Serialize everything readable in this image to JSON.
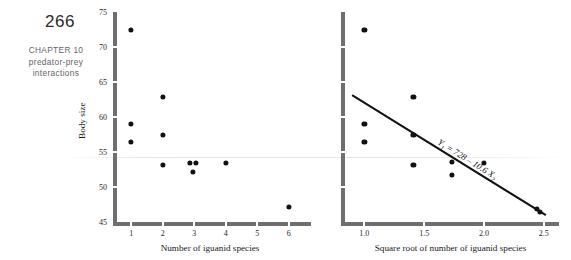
{
  "page": {
    "number": "266",
    "chapter_lines": [
      "CHAPTER 10",
      "predator-prey",
      "interactions"
    ]
  },
  "colors": {
    "axis_gray": "#6e6e6e",
    "dot_black": "#111111",
    "line_black": "#121212",
    "chapter_gray": "#5f6468"
  },
  "chart_data": [
    {
      "id": "left",
      "type": "scatter",
      "title": "",
      "xlabel": "Number of iguanid species",
      "ylabel": "Body size",
      "xlim": [
        0.55,
        6.45
      ],
      "ylim": [
        45,
        75
      ],
      "xticks": [
        1,
        2,
        3,
        4,
        5,
        6
      ],
      "xtick_labels": [
        "1",
        "2",
        "3",
        "4",
        "5",
        "6"
      ],
      "yticks": [
        45,
        50,
        55,
        60,
        65,
        70,
        75
      ],
      "ytick_labels": [
        "45",
        "50",
        "55",
        "60",
        "65",
        "70",
        "75"
      ],
      "grid": false,
      "legend": null,
      "points": [
        {
          "x": 1.0,
          "y": 72.4
        },
        {
          "x": 1.0,
          "y": 59.0
        },
        {
          "x": 1.0,
          "y": 56.5
        },
        {
          "x": 2.0,
          "y": 62.9
        },
        {
          "x": 2.0,
          "y": 57.4
        },
        {
          "x": 2.0,
          "y": 53.2
        },
        {
          "x": 2.85,
          "y": 53.4
        },
        {
          "x": 3.05,
          "y": 53.4
        },
        {
          "x": 2.95,
          "y": 52.1
        },
        {
          "x": 4.0,
          "y": 53.4
        },
        {
          "x": 6.0,
          "y": 47.1
        }
      ]
    },
    {
      "id": "right",
      "type": "scatter",
      "title": "",
      "xlabel": "Square root of number of iguanid species",
      "ylabel": "",
      "xlim": [
        0.88,
        2.56
      ],
      "ylim": [
        45,
        75
      ],
      "xticks": [
        1.0,
        1.5,
        2.0,
        2.5
      ],
      "xtick_labels": [
        "1.0",
        "1.5",
        "2.0",
        "2.5"
      ],
      "yticks": [
        45,
        50,
        55,
        60,
        65,
        70,
        75
      ],
      "ytick_labels": [
        "",
        "",
        "",
        "",
        "",
        "",
        ""
      ],
      "grid": false,
      "legend": null,
      "points": [
        {
          "x": 1.0,
          "y": 72.4
        },
        {
          "x": 1.0,
          "y": 59.0
        },
        {
          "x": 1.0,
          "y": 56.5
        },
        {
          "x": 1.41,
          "y": 62.9
        },
        {
          "x": 1.41,
          "y": 57.4
        },
        {
          "x": 1.41,
          "y": 53.2
        },
        {
          "x": 1.73,
          "y": 53.6
        },
        {
          "x": 1.73,
          "y": 51.7
        },
        {
          "x": 2.0,
          "y": 53.4
        },
        {
          "x": 2.44,
          "y": 46.9
        },
        {
          "x": 2.47,
          "y": 46.5
        }
      ],
      "fit_line": {
        "equation_text": "Y",
        "equation_sub1": "1",
        "equation_mid": " = 728 – 10.6 ",
        "equation_var": "X",
        "equation_sub2": "2",
        "intercept": 72.8,
        "slope": -10.6,
        "x_start": 0.9,
        "x_end": 2.52
      }
    }
  ]
}
